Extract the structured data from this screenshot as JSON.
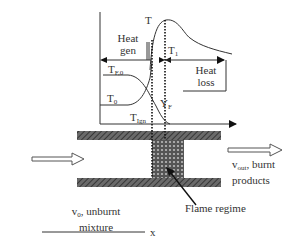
{
  "diagram": {
    "type": "premixed flame in a channel with temperature profile",
    "graph": {
      "curve_labels": {
        "temperature": "T",
        "t1": "T",
        "t1_sub": "1",
        "fuel_initial": "T",
        "fuel_initial_sub": "F,0",
        "ambient": "T",
        "ambient_sub": "0",
        "ignition": "T",
        "ignition_sub": "Ign",
        "fuel_mass_fraction": "Y",
        "fuel_mass_fraction_sub": "F"
      },
      "regions": {
        "heat_gen_line1": "Heat",
        "heat_gen_line2": "gen",
        "heat_loss_line1": "Heat",
        "heat_loss_line2": "loss"
      }
    },
    "channel": {
      "inlet_label_v": "v",
      "inlet_label_sub": "0",
      "inlet_label_rest": ", unburnt",
      "inlet_label_line2": "mixture",
      "outlet_label_v": "v",
      "outlet_label_sub": "out",
      "outlet_label_rest": ", burnt",
      "outlet_label_line2": "products",
      "flame_label": "Flame regime",
      "axis_label": "x"
    },
    "colors": {
      "line": "#222222",
      "wall_fill": "#555555",
      "flame_fill": "#666666",
      "background": "#ffffff"
    }
  }
}
